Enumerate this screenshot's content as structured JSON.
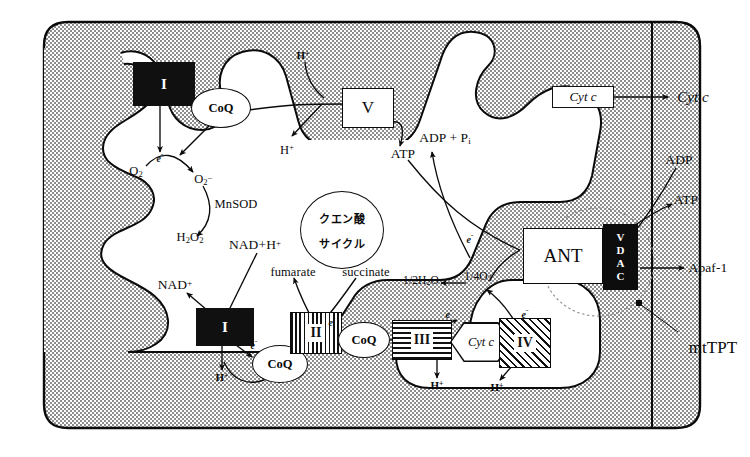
{
  "figure": {
    "background_color": "#ffffff",
    "ink_color": "#0a0a0a",
    "matrix_fill": "stippled-gray"
  },
  "complexes": [
    {
      "id": "complex-I-top",
      "label": "I",
      "style": "solid-black"
    },
    {
      "id": "complex-I-bottom",
      "label": "I",
      "style": "solid-black"
    },
    {
      "id": "complex-II",
      "label": "II",
      "style": "vertical-stripes"
    },
    {
      "id": "complex-III",
      "label": "III",
      "style": "horizontal-stripes"
    },
    {
      "id": "complex-IV",
      "label": "IV",
      "style": "diagonal-hatch"
    },
    {
      "id": "complex-V",
      "label": "V",
      "style": "white-box"
    }
  ],
  "carriers": {
    "coq_top": "CoQ",
    "coq_bottom": "CoQ",
    "coq_middle": "CoQ",
    "cytc_hexagon": "Cyt c",
    "cytc_boxed": "Cyt c",
    "cytc_released": "Cyt c"
  },
  "transporters": {
    "ant": "ANT",
    "vdac": "VDAC",
    "mtptp": "mtTPT"
  },
  "cycle": {
    "line1": "クエン酸",
    "line2": "サイクル"
  },
  "metabolites": {
    "o2": "O2",
    "superoxide": "O2-",
    "mnsod": "MnSOD",
    "h2o2": "H2O2",
    "nad_plus": "NAD+",
    "nadh": "NAD+H+",
    "fumarate": "fumarate",
    "succinate": "succinate",
    "half_water": "1/2H2O",
    "quarter_o2": "1/4O2",
    "adp_pi": "ADP + Pi",
    "atp_from_v": "ATP",
    "atp_out": "ATP",
    "adp_in": "ADP",
    "apaf1": "Apaf-1"
  },
  "proton_markers": [
    {
      "id": "h-top-above-v",
      "label": "H+"
    },
    {
      "id": "h-below-v",
      "label": "H+"
    },
    {
      "id": "h-complex-I",
      "label": "H+"
    },
    {
      "id": "h-complex-III",
      "label": "H+"
    },
    {
      "id": "h-complex-IV",
      "label": "H+"
    }
  ],
  "electron_markers": [
    {
      "id": "e-complex-I-top",
      "label": "e-"
    },
    {
      "id": "e-complex-I-bottom",
      "label": "e-"
    },
    {
      "id": "e-complex-II",
      "label": "e-"
    },
    {
      "id": "e-complex-III",
      "label": "e-"
    },
    {
      "id": "e-complex-IV",
      "label": "e-"
    },
    {
      "id": "e-ant-left",
      "label": "e-"
    }
  ]
}
